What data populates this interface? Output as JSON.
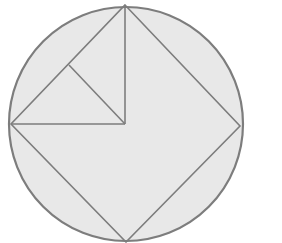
{
  "diagram": {
    "colors": {
      "background": "#ffffff",
      "circle_fill": "#e8e8e8",
      "stroke": "#7d7d7d"
    },
    "circle": {
      "cx": 126,
      "cy": 124,
      "r": 117
    },
    "square": {
      "points": "125,5 240,126 126,242 11,124"
    },
    "segments": [
      {
        "name": "vertical-segment",
        "x1": 125,
        "y1": 5,
        "x2": 125,
        "y2": 124
      },
      {
        "name": "horizontal-segment",
        "x1": 11,
        "y1": 124,
        "x2": 125,
        "y2": 124
      },
      {
        "name": "diagonal-segment",
        "x1": 69,
        "y1": 65,
        "x2": 125,
        "y2": 124
      }
    ]
  }
}
